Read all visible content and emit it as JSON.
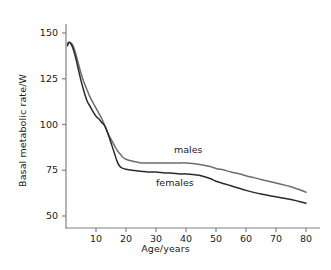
{
  "chart_data": {
    "type": "line",
    "title": "",
    "xlabel": "Age/years",
    "ylabel": "Basal metabolic rate/W",
    "xlim": [
      0,
      82
    ],
    "ylim": [
      45,
      152
    ],
    "xticks": [
      10,
      20,
      30,
      40,
      50,
      60,
      70,
      80
    ],
    "yticks": [
      50,
      75,
      100,
      125,
      150
    ],
    "grid": false,
    "legend_position": "inline-annotation",
    "series": [
      {
        "name": "males",
        "color": "#6d6d6d",
        "label": "males",
        "label_x": 36,
        "label_y": 86,
        "x": [
          0.5,
          1,
          2,
          3,
          4,
          5,
          6,
          7,
          8,
          9,
          10,
          11,
          12,
          13,
          14,
          15,
          16,
          17,
          18,
          19,
          20,
          22,
          25,
          28,
          30,
          33,
          35,
          38,
          40,
          43,
          45,
          48,
          50,
          53,
          55,
          58,
          60,
          65,
          70,
          75,
          80
        ],
        "y": [
          144,
          145,
          144,
          140,
          134,
          128,
          123,
          119,
          115,
          112,
          109,
          106,
          103,
          99,
          95,
          92,
          89,
          86,
          84,
          82,
          81,
          80,
          79,
          79,
          79,
          79,
          79,
          79,
          79,
          78.5,
          78,
          77,
          76,
          75,
          74,
          73,
          72,
          70,
          68,
          66,
          63
        ]
      },
      {
        "name": "females",
        "color": "#2b2b2b",
        "label": "females",
        "label_x": 30,
        "label_y": 68,
        "x": [
          0.5,
          1,
          2,
          3,
          4,
          5,
          6,
          7,
          8,
          9,
          10,
          11,
          12,
          13,
          14,
          15,
          16,
          17,
          18,
          19,
          20,
          22,
          25,
          28,
          30,
          33,
          35,
          38,
          40,
          43,
          45,
          48,
          50,
          53,
          55,
          58,
          60,
          65,
          70,
          75,
          80
        ],
        "y": [
          143,
          145,
          143,
          138,
          131,
          124,
          118,
          113,
          110,
          107,
          104.5,
          103,
          101,
          99,
          95,
          90,
          85,
          80,
          77,
          76,
          75.5,
          75,
          74.5,
          74,
          74,
          73.5,
          73.5,
          73,
          73,
          72.5,
          72,
          70.5,
          69,
          67.5,
          66.5,
          65,
          64,
          62,
          60.5,
          59,
          57
        ]
      }
    ],
    "annotations": [
      {
        "text": "males",
        "x": 36,
        "y": 86
      },
      {
        "text": "females",
        "x": 30,
        "y": 68
      }
    ]
  },
  "axes": {
    "y_axis_label": "Basal metabolic rate/W",
    "x_axis_label": "Age/years",
    "y_tick_labels": [
      "150",
      "125",
      "100",
      "75",
      "50"
    ],
    "x_tick_labels": [
      "10",
      "20",
      "30",
      "40",
      "50",
      "60",
      "70",
      "80"
    ]
  },
  "colors": {
    "males_line": "#6d6d6d",
    "females_line": "#2b2b2b",
    "axis": "#808080",
    "text": "#1a1a1a",
    "background": "#ffffff"
  }
}
